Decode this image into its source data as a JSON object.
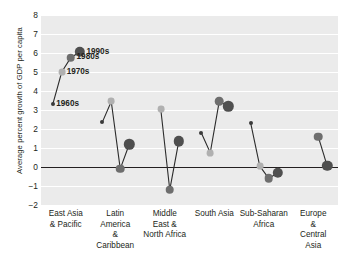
{
  "chart_data": {
    "type": "line",
    "title": "",
    "xlabel": "",
    "ylabel": "Average percent growth of GDP per capita",
    "ylim": [
      -2,
      8
    ],
    "yticks": [
      "8",
      "7",
      "6",
      "5",
      "4",
      "3",
      "2",
      "1",
      "0",
      "-1",
      "-2"
    ],
    "grid": true,
    "legend_position": "inline-annotations",
    "categories": [
      "East Asia & Pacific",
      "Latin America & Caribbean",
      "Middle East & North Africa",
      "South Asia",
      "Sub-Saharan Africa",
      "Europe & Central Asia"
    ],
    "category_lines": [
      [
        "East Asia",
        "& Pacific"
      ],
      [
        "Latin",
        "America",
        "&",
        "Caribbean"
      ],
      [
        "Middle",
        "East &",
        "North Africa"
      ],
      [
        "South Asia"
      ],
      [
        "Sub-Saharan",
        "Africa"
      ],
      [
        "Europe",
        "&",
        "Central",
        "Asia"
      ]
    ],
    "series": [
      {
        "name": "1960s",
        "values": [
          3.3,
          2.35,
          null,
          1.8,
          2.3,
          null
        ]
      },
      {
        "name": "1970s",
        "values": [
          5.0,
          3.45,
          3.05,
          0.75,
          0.05,
          null
        ]
      },
      {
        "name": "1980s",
        "values": [
          5.75,
          -0.1,
          -1.2,
          3.45,
          -0.6,
          1.6
        ]
      },
      {
        "name": "1990s",
        "values": [
          6.05,
          1.2,
          1.35,
          3.2,
          -0.3,
          0.05
        ]
      }
    ],
    "annotations": [
      {
        "label": "1990s",
        "series": "1990s",
        "category": "East Asia & Pacific"
      },
      {
        "label": "1980s",
        "series": "1980s",
        "category": "East Asia & Pacific"
      },
      {
        "label": "1970s",
        "series": "1970s",
        "category": "East Asia & Pacific"
      },
      {
        "label": "1960s",
        "series": "1960s",
        "category": "East Asia & Pacific"
      }
    ],
    "marker_style": [
      {
        "series": "1960s",
        "color": "#3a3a3a",
        "radius": 2.0
      },
      {
        "series": "1970s",
        "color": "#b0b0b0",
        "radius": 3.4
      },
      {
        "series": "1980s",
        "color": "#6e6e6e",
        "radius": 4.3
      },
      {
        "series": "1990s",
        "color": "#4f4f4f",
        "radius": 5.2
      }
    ],
    "colors": {
      "plot_background": "#ebebeb",
      "gridline": "#ffffff",
      "axis": "#231f20",
      "connector": "#2b2b2b",
      "text": "#231f20"
    }
  }
}
